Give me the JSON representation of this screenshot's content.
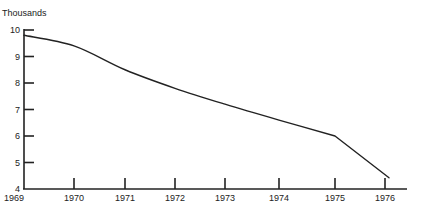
{
  "chart_data": {
    "type": "line",
    "title": "",
    "unit_label": "Thousands",
    "xlabel": "",
    "ylabel": "Thousands",
    "x": [
      1969,
      1970,
      1971,
      1972,
      1973,
      1974,
      1975,
      1976
    ],
    "x_tick_labels": [
      "1969",
      "1970",
      "1971",
      "1972",
      "1973",
      "1974",
      "1975",
      "1976"
    ],
    "y_ticks": [
      4,
      5,
      6,
      7,
      8,
      9,
      10
    ],
    "y_tick_labels": [
      "4",
      "5",
      "6",
      "7",
      "8",
      "9",
      "10"
    ],
    "ylim": [
      4,
      10
    ],
    "xlim": [
      1969,
      1976.4
    ],
    "grid": false,
    "legend": null,
    "series": [
      {
        "name": "Thousands",
        "values": [
          9.8,
          9.4,
          8.5,
          7.8,
          7.2,
          6.6,
          6.0,
          4.5
        ]
      }
    ],
    "line_color": "#222222"
  }
}
